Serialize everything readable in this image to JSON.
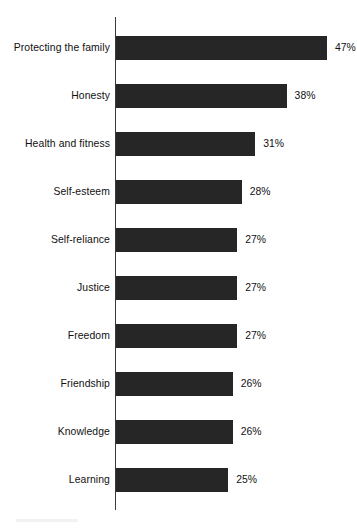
{
  "chart_data": {
    "type": "bar",
    "orientation": "horizontal",
    "title": "",
    "subtitle": "",
    "xlabel": "",
    "ylabel": "",
    "xlim": [
      0,
      47
    ],
    "grid": false,
    "legend": false,
    "value_suffix": "%",
    "categories": [
      "Protecting the family",
      "Honesty",
      "Health and fitness",
      "Self-esteem",
      "Self-reliance",
      "Justice",
      "Freedom",
      "Friendship",
      "Knowledge",
      "Learning"
    ],
    "values": [
      47,
      38,
      31,
      28,
      27,
      27,
      27,
      26,
      26,
      25
    ],
    "value_labels": [
      "47%",
      "38%",
      "31%",
      "28%",
      "27%",
      "27%",
      "27%",
      "26%",
      "26%",
      "25%"
    ],
    "bars": [
      {
        "category": "Protecting the family",
        "value": 47,
        "label": "47%"
      },
      {
        "category": "Honesty",
        "value": 38,
        "label": "38%"
      },
      {
        "category": "Health and fitness",
        "value": 31,
        "label": "31%"
      },
      {
        "category": "Self-esteem",
        "value": 28,
        "label": "28%"
      },
      {
        "category": "Self-reliance",
        "value": 27,
        "label": "27%"
      },
      {
        "category": "Justice",
        "value": 27,
        "label": "27%"
      },
      {
        "category": "Freedom",
        "value": 27,
        "label": "27%"
      },
      {
        "category": "Friendship",
        "value": 26,
        "label": "26%"
      },
      {
        "category": "Knowledge",
        "value": 26,
        "label": "26%"
      },
      {
        "category": "Learning",
        "value": 25,
        "label": "25%"
      }
    ],
    "colors": {
      "bar": "#262626",
      "axis": "#3b3b3b",
      "text": "#111111",
      "background": "#ffffff"
    }
  },
  "layout": {
    "axis_x": 116,
    "axis_top": 17,
    "axis_bottom": 510,
    "first_bar_top": 36,
    "bar_height": 24,
    "bar_pitch": 48,
    "px_per_unit": 4.49,
    "label_right_edge": 110,
    "value_gap": 8
  }
}
